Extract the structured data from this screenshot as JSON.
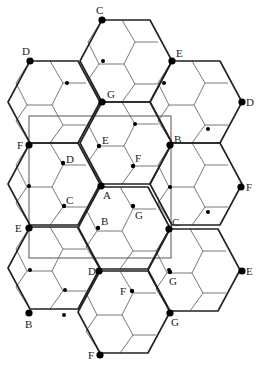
{
  "diagram": {
    "colors": {
      "thick_line": "#222222",
      "thin_line": "#555555",
      "point": "#000000",
      "background": "#ffffff"
    },
    "hexagon": {
      "offsets": [
        [
          22,
          -41
        ],
        [
          70,
          -41
        ],
        [
          92,
          0
        ],
        [
          70,
          41
        ],
        [
          22,
          41
        ],
        [
          0,
          0
        ]
      ]
    },
    "hex_left_vertices": [
      [
        80,
        61
      ],
      [
        150,
        102
      ],
      [
        8,
        102
      ],
      [
        80,
        143
      ],
      [
        8,
        184
      ],
      [
        150,
        184
      ],
      [
        78,
        228
      ],
      [
        8,
        268
      ],
      [
        148,
        270
      ],
      [
        78,
        312
      ]
    ],
    "rectangle": {
      "x": 29,
      "y": 116,
      "width": 142,
      "height": 142
    },
    "major_points": [
      {
        "label": "C",
        "x": 102,
        "y": 20,
        "lx": 96,
        "ly": 14
      },
      {
        "label": "E",
        "x": 172,
        "y": 61,
        "lx": 176,
        "ly": 57
      },
      {
        "label": "D",
        "x": 30,
        "y": 61,
        "lx": 22,
        "ly": 55
      },
      {
        "label": "G",
        "x": 102,
        "y": 102,
        "lx": 107,
        "ly": 98
      },
      {
        "label": "D",
        "x": 242,
        "y": 102,
        "lx": 246,
        "ly": 106
      },
      {
        "label": "F",
        "x": 29,
        "y": 145,
        "lx": 17,
        "ly": 149
      },
      {
        "label": "B",
        "x": 170,
        "y": 145,
        "lx": 174,
        "ly": 143
      },
      {
        "label": "A",
        "x": 101,
        "y": 186,
        "lx": 103,
        "ly": 199
      },
      {
        "label": "F",
        "x": 241,
        "y": 187,
        "lx": 246,
        "ly": 191
      },
      {
        "label": "E",
        "x": 29,
        "y": 228,
        "lx": 15,
        "ly": 232
      },
      {
        "label": "C",
        "x": 169,
        "y": 229,
        "lx": 172,
        "ly": 226
      },
      {
        "label": "D",
        "x": 99,
        "y": 271,
        "lx": 88,
        "ly": 275
      },
      {
        "label": "E",
        "x": 242,
        "y": 271,
        "lx": 246,
        "ly": 275
      },
      {
        "label": "B",
        "x": 29,
        "y": 313,
        "lx": 25,
        "ly": 328
      },
      {
        "label": "G",
        "x": 170,
        "y": 313,
        "lx": 171,
        "ly": 326
      },
      {
        "label": "F",
        "x": 100,
        "y": 355,
        "lx": 88,
        "ly": 359
      }
    ],
    "minor_points": [
      {
        "label": "E",
        "x": 99,
        "y": 146,
        "lx": 102,
        "ly": 144
      },
      {
        "label": "F",
        "x": 133,
        "y": 166,
        "lx": 135,
        "ly": 162
      },
      {
        "label": "D",
        "x": 63,
        "y": 163,
        "lx": 66,
        "ly": 163
      },
      {
        "label": "C",
        "x": 64,
        "y": 206,
        "lx": 66,
        "ly": 204
      },
      {
        "label": "B",
        "x": 98,
        "y": 228,
        "lx": 101,
        "ly": 225
      },
      {
        "label": "G",
        "x": 133,
        "y": 206,
        "lx": 135,
        "ly": 219
      },
      {
        "label": "G",
        "x": 170,
        "y": 272,
        "lx": 169,
        "ly": 285
      },
      {
        "label": "F",
        "x": 132,
        "y": 291,
        "lx": 120,
        "ly": 295
      }
    ],
    "minor_dots_unlabeled": [
      [
        103,
        61
      ],
      [
        67,
        83
      ],
      [
        164,
        83
      ],
      [
        135,
        124
      ],
      [
        208,
        129
      ],
      [
        29,
        186
      ],
      [
        170,
        187
      ],
      [
        208,
        212
      ],
      [
        65,
        290
      ],
      [
        64,
        315
      ],
      [
        169,
        270
      ],
      [
        30,
        270
      ]
    ]
  }
}
